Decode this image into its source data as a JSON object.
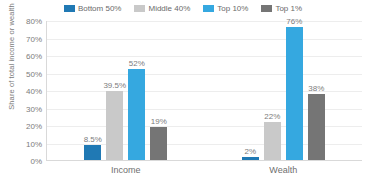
{
  "chart_data": {
    "type": "bar",
    "title": "",
    "subtitle": "",
    "xlabel": "",
    "ylabel": "Share of total income or wealth",
    "categories": [
      "Income",
      "Wealth"
    ],
    "series": [
      {
        "name": "Bottom 50%",
        "color": "#2079b4",
        "values": [
          8.5,
          2
        ],
        "labels": [
          "8.5%",
          "2%"
        ]
      },
      {
        "name": "Middle 40%",
        "color": "#c9c9c9",
        "values": [
          39.5,
          22
        ],
        "labels": [
          "39.5%",
          "22%"
        ]
      },
      {
        "name": "Top 10%",
        "color": "#35a8e0",
        "values": [
          52,
          76
        ],
        "labels": [
          "52%",
          "76%"
        ]
      },
      {
        "name": "Top 1%",
        "color": "#757575",
        "values": [
          19,
          38
        ],
        "labels": [
          "19%",
          "38%"
        ]
      }
    ],
    "ylim": [
      0,
      80
    ],
    "ytick_values": [
      80,
      70,
      60,
      50,
      40,
      30,
      20,
      10,
      0
    ],
    "ytick_labels": [
      "80%",
      "70%",
      "60%",
      "50%",
      "40%",
      "30%",
      "20%",
      "10%",
      "0%"
    ],
    "grid": true,
    "legend_position": "top-center",
    "gridline_color": "#ededed",
    "axis_color": "#d9d9d9",
    "text_color": "#7c7c7c",
    "background": "#ffffff"
  }
}
